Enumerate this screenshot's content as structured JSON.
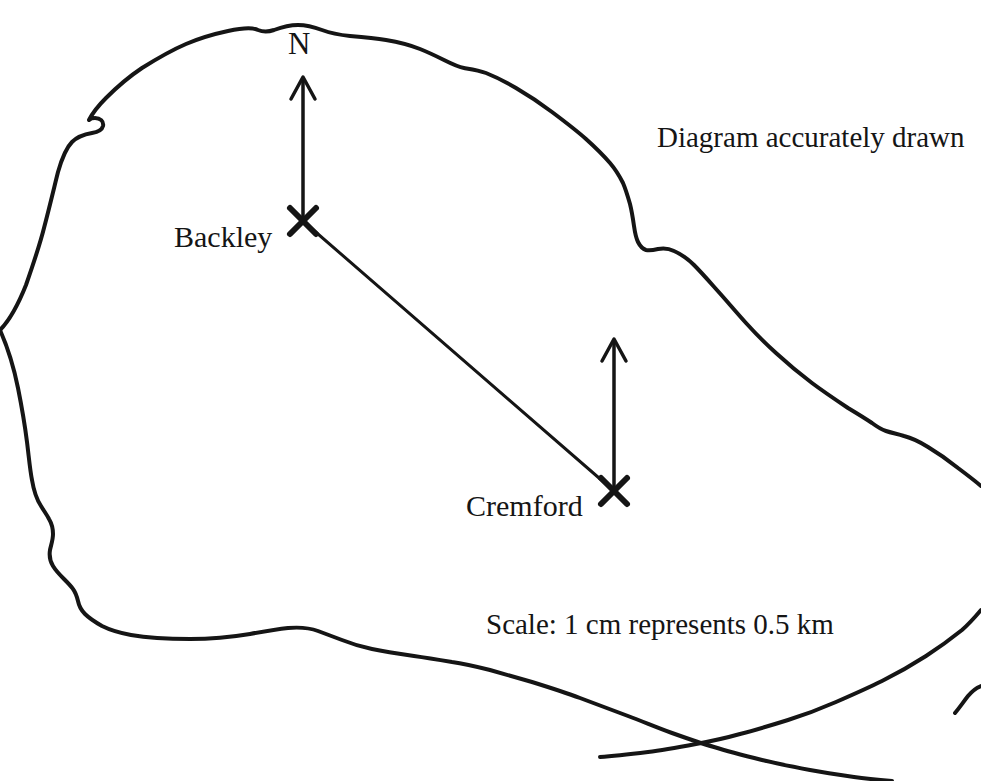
{
  "diagram": {
    "kind": "island-map-bearing-diagram",
    "note_text": "Diagram accurately drawn",
    "scale_text": "Scale: 1 cm represents 0.5 km",
    "north_label": "N",
    "ink_color": "#151515",
    "background_color": "#ffffff",
    "places": [
      {
        "id": "backley",
        "label": "Backley",
        "marker": "x-cross-marker",
        "x": 303,
        "y": 221,
        "has_north_arrow": true
      },
      {
        "id": "cremford",
        "label": "Cremford",
        "marker": "x-cross-marker",
        "x": 614,
        "y": 491,
        "has_north_arrow": true
      }
    ],
    "connector": {
      "id": "backley-cremford-line",
      "from": "backley",
      "to": "cremford"
    },
    "north_arrows": [
      {
        "id": "north-arrow-backley",
        "x": 303,
        "tail_y": 221,
        "head_y": 78
      },
      {
        "id": "north-arrow-cremford",
        "x": 614,
        "tail_y": 491,
        "head_y": 340
      }
    ]
  }
}
